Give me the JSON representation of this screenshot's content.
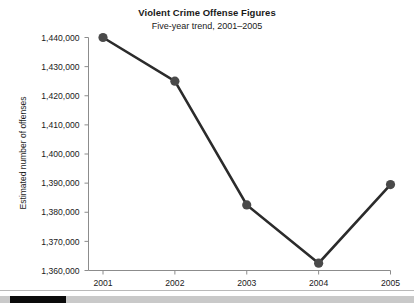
{
  "chart_data": {
    "type": "line",
    "title": "Violent Crime Offense Figures",
    "subtitle": "Five-year trend, 2001–2005",
    "xlabel": "",
    "ylabel": "Estimated number of offenses",
    "categories": [
      "2001",
      "2002",
      "2003",
      "2004",
      "2005"
    ],
    "values": [
      1440000,
      1425000,
      1382500,
      1362500,
      1389500
    ],
    "ylim": [
      1360000,
      1440000
    ],
    "ytick_step": 10000,
    "ytick_labels": [
      "1,440,000",
      "1,430,000",
      "1,420,000",
      "1,410,000",
      "1,400,000",
      "1,390,000",
      "1,380,000",
      "1,370,000",
      "1,360,000"
    ],
    "ytick_values": [
      1440000,
      1430000,
      1420000,
      1410000,
      1400000,
      1390000,
      1380000,
      1370000,
      1360000
    ],
    "xtick_labels": [
      "2001",
      "2002",
      "2003",
      "2004",
      "2005"
    ],
    "grid": false,
    "legend": null,
    "series": [
      {
        "name": "Estimated number of offenses",
        "values": [
          1440000,
          1425000,
          1382500,
          1362500,
          1389500
        ],
        "color": "#2b2b2b",
        "marker": "circle"
      }
    ],
    "colors": {
      "line": "#2b2b2b",
      "marker": "#4a4a4a",
      "axis": "#808080",
      "text": "#1a1a1a",
      "background": "#ffffff"
    }
  },
  "scrollbar": {
    "orientation": "horizontal",
    "thumb_position": "left",
    "track_color": "#c9c9c9",
    "thumb_color": "#0b0b0b"
  }
}
